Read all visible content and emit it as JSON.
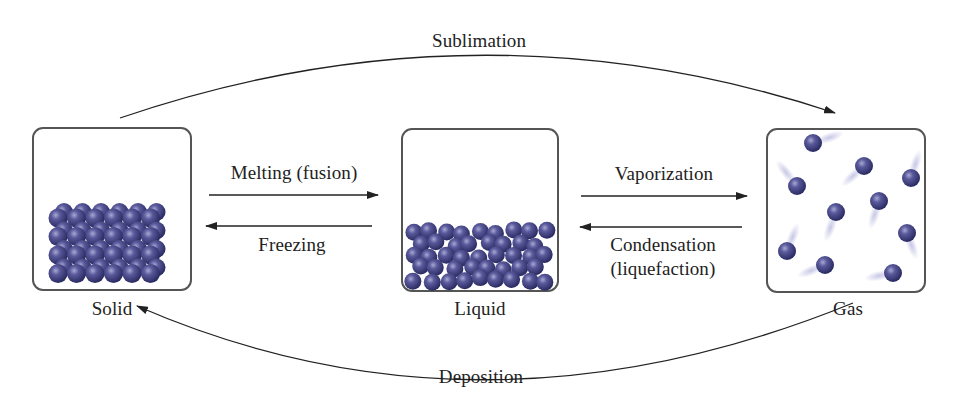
{
  "diagram": {
    "states": [
      {
        "id": "solid",
        "label": "Solid"
      },
      {
        "id": "liquid",
        "label": "Liquid"
      },
      {
        "id": "gas",
        "label": "Gas"
      }
    ],
    "transitions": {
      "sublimation": {
        "label": "Sublimation",
        "from": "solid",
        "to": "gas"
      },
      "deposition": {
        "label": "Deposition",
        "from": "gas",
        "to": "solid"
      },
      "melting": {
        "label": "Melting (fusion)",
        "from": "solid",
        "to": "liquid"
      },
      "freezing": {
        "label": "Freezing",
        "from": "liquid",
        "to": "solid"
      },
      "vaporization": {
        "label": "Vaporization",
        "from": "liquid",
        "to": "gas"
      },
      "condensation": {
        "label_line1": "Condensation",
        "label_line2": "(liquefaction)",
        "from": "gas",
        "to": "liquid"
      }
    },
    "colors": {
      "particle": "#3b3b7d",
      "particle_highlight": "#9a9ac8",
      "border": "#555555",
      "arrow": "#222222"
    }
  }
}
